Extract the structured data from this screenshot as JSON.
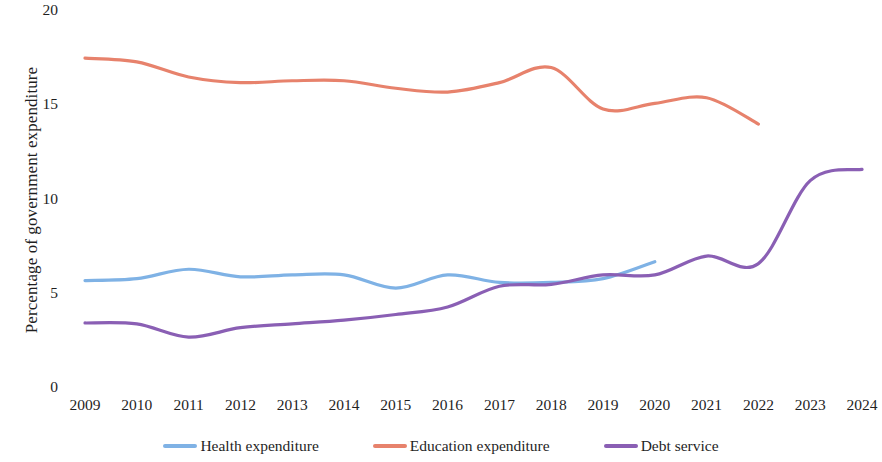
{
  "chart_data": {
    "type": "line",
    "title": "",
    "xlabel": "",
    "ylabel": "Percentage of government expenditure",
    "x": [
      2009,
      2010,
      2011,
      2012,
      2013,
      2014,
      2015,
      2016,
      2017,
      2018,
      2019,
      2020,
      2021,
      2022,
      2023,
      2024
    ],
    "categories": [
      "2009",
      "2010",
      "2011",
      "2012",
      "2013",
      "2014",
      "2015",
      "2016",
      "2017",
      "2018",
      "2019",
      "2020",
      "2021",
      "2022",
      "2023",
      "2024"
    ],
    "ylim": [
      0,
      20
    ],
    "yticks": [
      0,
      5,
      10,
      15,
      20
    ],
    "ytick_labels": [
      "0",
      "5",
      "10",
      "15",
      "20"
    ],
    "xlim": [
      2009,
      2024
    ],
    "grid": false,
    "legend_position": "bottom",
    "smoothing": "spline",
    "series": [
      {
        "name": "Health expenditure",
        "color": "#7FB2E5",
        "values": [
          5.7,
          5.8,
          6.3,
          5.9,
          6.0,
          6.0,
          5.3,
          6.0,
          5.6,
          5.6,
          5.8,
          6.7,
          null,
          null,
          null,
          null
        ]
      },
      {
        "name": "Education expenditure",
        "color": "#E7826C",
        "values": [
          17.5,
          17.3,
          16.5,
          16.2,
          16.3,
          16.3,
          15.9,
          15.7,
          16.2,
          17.0,
          14.8,
          15.1,
          15.4,
          14.0,
          null,
          null
        ]
      },
      {
        "name": "Debt service",
        "color": "#8A5FB4",
        "values": [
          3.45,
          3.4,
          2.7,
          3.2,
          3.4,
          3.6,
          3.9,
          4.3,
          5.4,
          5.5,
          6.0,
          6.0,
          7.0,
          6.6,
          11.0,
          11.6
        ]
      }
    ]
  },
  "axis": {
    "y_label": "Percentage of government expenditure",
    "y_ticks": [
      {
        "label": "20",
        "value": 20
      },
      {
        "label": "15",
        "value": 15
      },
      {
        "label": "10",
        "value": 10
      },
      {
        "label": "5",
        "value": 5
      },
      {
        "label": "0",
        "value": 0
      }
    ],
    "x_ticks": [
      {
        "label": "2009"
      },
      {
        "label": "2010"
      },
      {
        "label": "2011"
      },
      {
        "label": "2012"
      },
      {
        "label": "2013"
      },
      {
        "label": "2014"
      },
      {
        "label": "2015"
      },
      {
        "label": "2016"
      },
      {
        "label": "2017"
      },
      {
        "label": "2018"
      },
      {
        "label": "2019"
      },
      {
        "label": "2020"
      },
      {
        "label": "2021"
      },
      {
        "label": "2022"
      },
      {
        "label": "2023"
      },
      {
        "label": "2024"
      }
    ]
  },
  "legend": {
    "items": [
      {
        "label": "Health expenditure",
        "color": "#7FB2E5"
      },
      {
        "label": "Education expenditure",
        "color": "#E7826C"
      },
      {
        "label": "Debt service",
        "color": "#8A5FB4"
      }
    ]
  }
}
